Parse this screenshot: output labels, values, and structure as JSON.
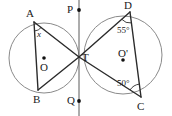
{
  "figure": {
    "width": 172,
    "height": 116,
    "stroke_color": "#2b2b2b",
    "circle_color": "#8a8a8a",
    "background": "#ffffff"
  },
  "points": {
    "A": {
      "label": "A",
      "x": 34,
      "y": 22,
      "label_x": 26,
      "label_y": 8
    },
    "B": {
      "label": "B",
      "x": 38,
      "y": 90,
      "label_x": 33,
      "label_y": 94
    },
    "C": {
      "label": "C",
      "x": 141,
      "y": 97,
      "label_x": 137,
      "label_y": 101
    },
    "D": {
      "label": "D",
      "x": 130,
      "y": 12,
      "label_x": 124,
      "label_y": 0
    },
    "T": {
      "label": "T",
      "x": 79,
      "y": 57,
      "label_x": 82,
      "label_y": 52
    },
    "P": {
      "label": "P",
      "x": 79,
      "y": 10,
      "label_x": 67,
      "label_y": 4
    },
    "Q": {
      "label": "Q",
      "x": 79,
      "y": 101,
      "label_x": 67,
      "label_y": 95
    },
    "O": {
      "label": "O",
      "x": 44,
      "y": 58,
      "label_x": 40,
      "label_y": 62
    },
    "Oprime": {
      "label": "O'",
      "x": 123,
      "y": 60,
      "label_x": 118,
      "label_y": 48
    }
  },
  "circles": {
    "left": {
      "cx": 44,
      "cy": 58,
      "r": 35
    },
    "right": {
      "cx": 123,
      "cy": 55,
      "r": 39
    }
  },
  "angles": {
    "at_A": {
      "label": "x",
      "x": 37,
      "y": 30
    },
    "at_D": {
      "label": "55°",
      "x": 117,
      "y": 26
    },
    "at_C": {
      "label": "50°",
      "x": 117,
      "y": 79
    }
  },
  "lines": {
    "vertical": {
      "x": 79,
      "y1": 0,
      "y2": 116
    },
    "segments": [
      {
        "name": "A-T",
        "x1": 34,
        "y1": 22,
        "x2": 79,
        "y2": 57
      },
      {
        "name": "B-T",
        "x1": 38,
        "y1": 90,
        "x2": 79,
        "y2": 57
      },
      {
        "name": "A-B",
        "x1": 34,
        "y1": 22,
        "x2": 38,
        "y2": 90
      },
      {
        "name": "D-T",
        "x1": 130,
        "y1": 12,
        "x2": 79,
        "y2": 57
      },
      {
        "name": "C-T",
        "x1": 141,
        "y1": 97,
        "x2": 79,
        "y2": 57
      },
      {
        "name": "D-C",
        "x1": 130,
        "y1": 12,
        "x2": 141,
        "y2": 97
      }
    ]
  }
}
